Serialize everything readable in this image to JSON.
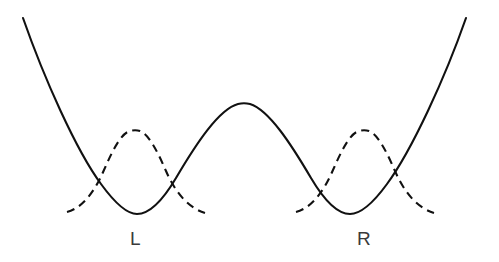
{
  "figure": {
    "type": "double-well-potential-diagram",
    "background_color": "#ffffff",
    "stroke_color": "#111111",
    "label_color": "#3a3a3a",
    "width": 499,
    "height": 262,
    "labels": {
      "left_well": "L",
      "right_well": "R"
    }
  },
  "chart_data": {
    "type": "line",
    "title": "",
    "xlabel": "",
    "ylabel": "",
    "xlim": [
      0,
      499
    ],
    "ylim": [
      262,
      0
    ],
    "grid": false,
    "legend": "none",
    "annotations": [
      {
        "text": "L",
        "x": 137,
        "y": 238,
        "target": "left-well-minimum"
      },
      {
        "text": "R",
        "x": 363,
        "y": 238,
        "target": "right-well-minimum"
      }
    ],
    "series": [
      {
        "name": "double-well-potential",
        "style": "solid",
        "stroke": "#111111",
        "stroke_width": 2.1,
        "path": "M 23,18 C 44,78 76,150 101,184 C 117,206 128,214 137,214 C 150,214 163,200 176,178 C 196,144 219,109 238,104 C 242,103 246,103 250,104 C 269,110 291,144 311,178 C 324,200 337,214 350,214 C 360,214 371,206 387,184 C 412,150 445,78 466,18",
        "key_points": [
          {
            "name": "left-branch-top",
            "x": 23,
            "y": 18
          },
          {
            "name": "left-well-minimum",
            "x": 137,
            "y": 214
          },
          {
            "name": "central-barrier-peak",
            "x": 248,
            "y": 103
          },
          {
            "name": "right-well-minimum",
            "x": 362,
            "y": 214
          },
          {
            "name": "right-branch-top",
            "x": 466,
            "y": 18
          }
        ]
      },
      {
        "name": "left-localized-wavefunction",
        "style": "dashed",
        "stroke": "#111111",
        "stroke_width": 2.1,
        "dasharray": "8 5.5",
        "path": "M 67,212 C 82,208 94,193 104,170 C 114,147 122,133 130,131 C 133,130 137,130 140,131 C 148,134 156,148 166,171 C 176,194 189,208 205,213",
        "key_points": [
          {
            "name": "left-wavefunction-peak",
            "x": 135,
            "y": 130
          },
          {
            "name": "left-wavefunction-left-tail",
            "x": 67,
            "y": 212
          },
          {
            "name": "left-wavefunction-right-tail",
            "x": 205,
            "y": 213
          }
        ]
      },
      {
        "name": "right-localized-wavefunction",
        "style": "dashed",
        "stroke": "#111111",
        "stroke_width": 2.1,
        "dasharray": "8 5.5",
        "path": "M 296,212 C 311,208 323,193 333,170 C 343,147 351,133 359,131 C 362,130 366,130 369,131 C 377,134 385,148 395,171 C 405,194 418,208 434,213",
        "key_points": [
          {
            "name": "right-wavefunction-peak",
            "x": 364,
            "y": 130
          },
          {
            "name": "right-wavefunction-left-tail",
            "x": 296,
            "y": 212
          },
          {
            "name": "right-wavefunction-right-tail",
            "x": 434,
            "y": 213
          }
        ]
      }
    ]
  }
}
